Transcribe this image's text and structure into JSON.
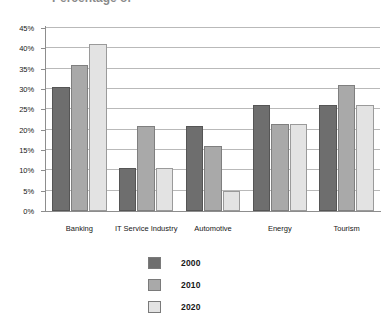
{
  "title": "Percentage of",
  "chart_data": {
    "type": "bar",
    "title": "Percentage of",
    "xlabel": "",
    "ylabel": "",
    "ylim": [
      0,
      45
    ],
    "ytick_labels": [
      "0%",
      "5%",
      "10%",
      "15%",
      "20%",
      "25%",
      "30%",
      "35%",
      "40%",
      "45%"
    ],
    "ytick_values": [
      0,
      5,
      10,
      15,
      20,
      25,
      30,
      35,
      40,
      45
    ],
    "grid": true,
    "legend_position": "bottom-center",
    "categories": [
      "Banking",
      "IT Service Industry",
      "Automotive",
      "Energy",
      "Tourism"
    ],
    "series": [
      {
        "name": "2000",
        "color": "#6e6e6e",
        "values": [
          30.5,
          10.5,
          21,
          26,
          26
        ]
      },
      {
        "name": "2010",
        "color": "#a9a9a9",
        "values": [
          36,
          21,
          16,
          21.3,
          31
        ]
      },
      {
        "name": "2020",
        "color": "#e3e3e3",
        "values": [
          41,
          10.5,
          5,
          21.3,
          26
        ]
      }
    ]
  }
}
